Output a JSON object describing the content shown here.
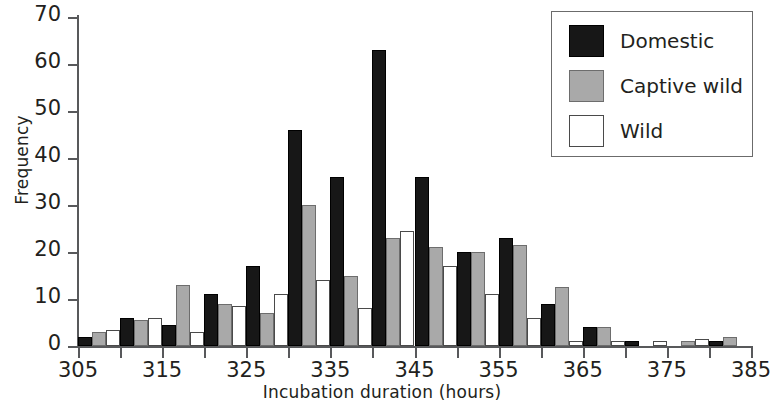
{
  "chart_data": {
    "type": "bar",
    "title": "",
    "subtitle": "",
    "xlabel": "Incubation duration (hours)",
    "ylabel": "Frequency",
    "xlim": [
      305,
      385
    ],
    "ylim": [
      0,
      70
    ],
    "ytick_values": [
      0,
      10,
      20,
      30,
      40,
      50,
      60,
      70
    ],
    "ytick_labels": [
      "0",
      "10",
      "20",
      "30",
      "40",
      "50",
      "60",
      "70"
    ],
    "xtick_values": [
      305,
      315,
      325,
      335,
      345,
      355,
      365,
      375,
      385
    ],
    "xtick_labels": [
      "305",
      "315",
      "325",
      "335",
      "345",
      "355",
      "365",
      "375",
      "385"
    ],
    "xminor_values": [
      310,
      320,
      330,
      340,
      350,
      360,
      370,
      380
    ],
    "grid": false,
    "legend_position": "top-right",
    "bin_width": 5,
    "categories": [
      305,
      310,
      315,
      320,
      325,
      330,
      335,
      340,
      345,
      350,
      355,
      360,
      365,
      370,
      375,
      380
    ],
    "series": [
      {
        "name": "Domestic",
        "color": "#171717",
        "values": [
          2,
          6,
          4.5,
          11,
          17,
          46,
          36,
          63,
          36,
          20,
          23,
          9,
          4,
          1,
          0,
          1
        ]
      },
      {
        "name": "Captive wild",
        "color": "#a9a9a9",
        "values": [
          3,
          5.5,
          13,
          9,
          7,
          30,
          15,
          23,
          21,
          20,
          21.5,
          12.5,
          4,
          0,
          1,
          2
        ]
      },
      {
        "name": "Wild",
        "color": "#ffffff",
        "values": [
          3.5,
          6,
          3,
          8.5,
          11,
          14,
          8,
          24.5,
          17,
          11,
          6,
          1,
          1,
          1,
          1.5,
          0
        ]
      }
    ]
  },
  "legend": {
    "items": [
      {
        "label": "Domestic",
        "swatch": "domestic"
      },
      {
        "label": "Captive wild",
        "swatch": "captive"
      },
      {
        "label": "Wild",
        "swatch": "wild"
      }
    ]
  }
}
